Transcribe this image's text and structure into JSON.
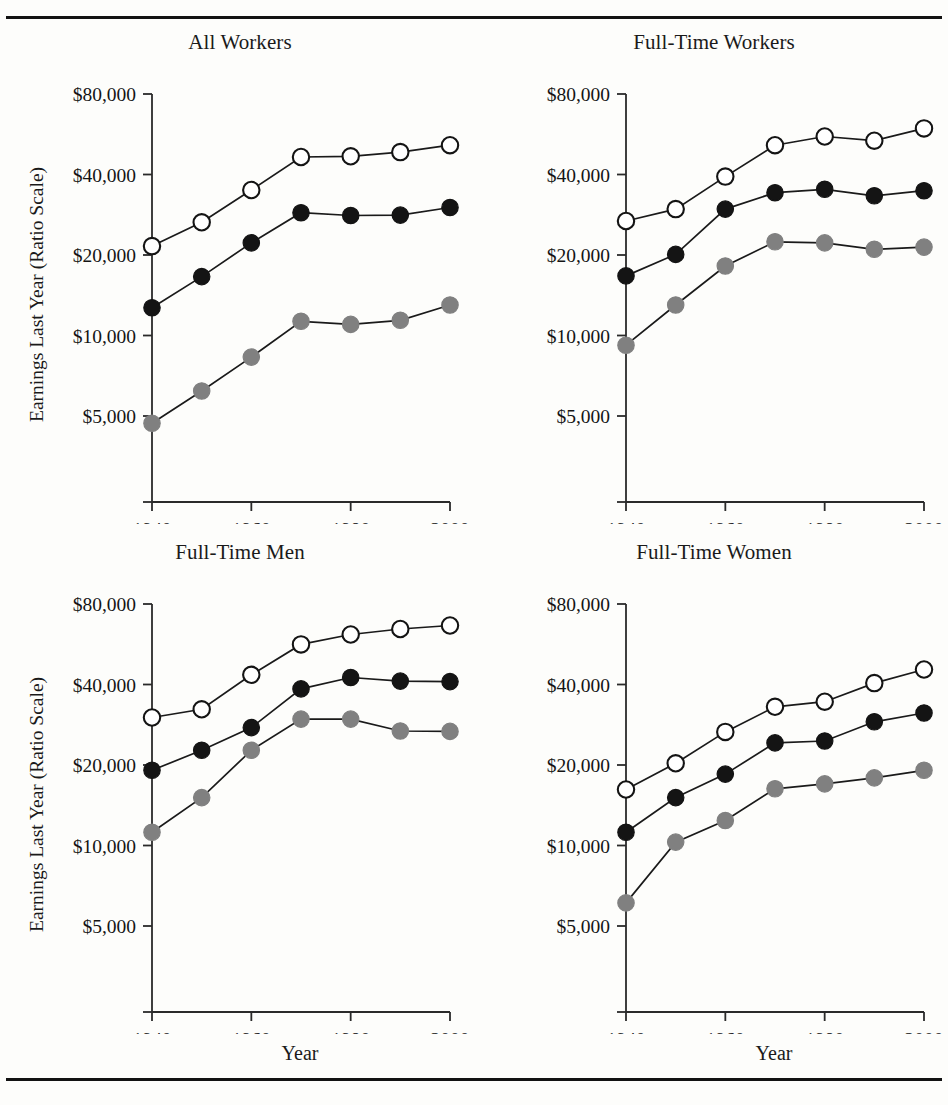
{
  "figure": {
    "y_axis_label": "Earnings Last Year (Ratio Scale)",
    "x_axis_label": "Year",
    "y_tick_labels": [
      "$80,000",
      "$40,000",
      "$20,000",
      "$10,000",
      "$5,000"
    ],
    "y_tick_values": [
      80000,
      40000,
      20000,
      10000,
      5000
    ],
    "x_tick_labels": [
      "1940",
      "1960",
      "1980",
      "2000"
    ],
    "x_tick_values": [
      1940,
      1960,
      1980,
      2000
    ],
    "rule_color": "#121212",
    "series_colors": {
      "p75": "#ffffff",
      "p50": "#141414",
      "p25": "#808080",
      "outline": "#141414",
      "line": "#1a1a1a"
    }
  },
  "chart_data": [
    {
      "type": "line",
      "title": "All Workers",
      "xlabel": "",
      "ylabel": "Earnings Last Year (Ratio Scale)",
      "scale": "log",
      "xlim": [
        1936,
        2004
      ],
      "ylim": [
        3300,
        92000
      ],
      "grid": false,
      "legend": "none",
      "x": [
        1940,
        1950,
        1960,
        1970,
        1980,
        1990,
        2000
      ],
      "series": [
        {
          "name": "75th percentile",
          "marker": "open-circle",
          "values": [
            21600,
            26500,
            35000,
            46500,
            46800,
            48500,
            51500
          ]
        },
        {
          "name": "50th percentile",
          "marker": "filled-circle",
          "values": [
            12700,
            16600,
            22200,
            28800,
            28100,
            28200,
            30100
          ]
        },
        {
          "name": "25th percentile",
          "marker": "gray-circle",
          "values": [
            4700,
            6200,
            8300,
            11300,
            11000,
            11400,
            13000
          ]
        }
      ]
    },
    {
      "type": "line",
      "title": "Full-Time Workers",
      "xlabel": "",
      "ylabel": "",
      "scale": "log",
      "xlim": [
        1936,
        2004
      ],
      "ylim": [
        3300,
        92000
      ],
      "grid": false,
      "legend": "none",
      "x": [
        1940,
        1950,
        1960,
        1970,
        1980,
        1990,
        2000
      ],
      "series": [
        {
          "name": "75th percentile",
          "marker": "open-circle",
          "values": [
            26800,
            29700,
            39300,
            51500,
            55500,
            53500,
            59500
          ]
        },
        {
          "name": "50th percentile",
          "marker": "filled-circle",
          "values": [
            16700,
            20100,
            29700,
            34200,
            35200,
            33300,
            34800
          ]
        },
        {
          "name": "25th percentile",
          "marker": "gray-circle",
          "values": [
            9200,
            13000,
            18200,
            22400,
            22200,
            21000,
            21400
          ]
        }
      ]
    },
    {
      "type": "line",
      "title": "Full-Time Men",
      "xlabel": "Year",
      "ylabel": "Earnings Last Year (Ratio Scale)",
      "scale": "log",
      "xlim": [
        1936,
        2004
      ],
      "ylim": [
        3300,
        92000
      ],
      "grid": false,
      "legend": "none",
      "x": [
        1940,
        1950,
        1960,
        1970,
        1980,
        1990,
        2000
      ],
      "series": [
        {
          "name": "75th percentile",
          "marker": "open-circle",
          "values": [
            30100,
            32300,
            43500,
            56500,
            61500,
            64500,
            66500
          ]
        },
        {
          "name": "50th percentile",
          "marker": "filled-circle",
          "values": [
            19100,
            22700,
            27600,
            38500,
            42500,
            41200,
            41000
          ]
        },
        {
          "name": "25th percentile",
          "marker": "gray-circle",
          "values": [
            11200,
            15100,
            22700,
            29700,
            29700,
            26800,
            26700
          ]
        }
      ]
    },
    {
      "type": "line",
      "title": "Full-Time Women",
      "xlabel": "Year",
      "ylabel": "",
      "scale": "log",
      "xlim": [
        1936,
        2004
      ],
      "ylim": [
        3300,
        92000
      ],
      "grid": false,
      "legend": "none",
      "x": [
        1940,
        1950,
        1960,
        1970,
        1980,
        1990,
        2000
      ],
      "series": [
        {
          "name": "75th percentile",
          "marker": "open-circle",
          "values": [
            16200,
            20300,
            26600,
            33000,
            34500,
            40500,
            45500
          ]
        },
        {
          "name": "50th percentile",
          "marker": "filled-circle",
          "values": [
            11200,
            15100,
            18500,
            24200,
            24600,
            29000,
            31300
          ]
        },
        {
          "name": "25th percentile",
          "marker": "gray-circle",
          "values": [
            6100,
            10300,
            12400,
            16300,
            17000,
            17900,
            19100
          ]
        }
      ]
    }
  ]
}
